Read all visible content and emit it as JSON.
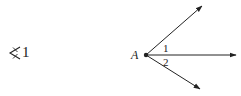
{
  "left_symbol": {
    "icon": "angle-icon",
    "number": "1"
  },
  "diagram": {
    "vertex_label": "A",
    "angle_labels": [
      "1",
      "2"
    ],
    "rays": [
      "upper-ray",
      "middle-ray",
      "lower-ray"
    ],
    "stroke_color": "#222222"
  }
}
